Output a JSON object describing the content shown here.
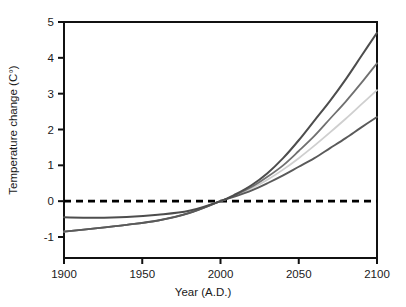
{
  "chart_data": {
    "type": "line",
    "title": "",
    "xlabel": "Year (A.D.)",
    "ylabel": "Temperature change (C°)",
    "xlim": [
      1900,
      2100
    ],
    "ylim": [
      -1,
      5
    ],
    "xticks": [
      1900,
      1950,
      2000,
      2050,
      2100
    ],
    "xtick_labels": [
      "1900",
      "1950",
      "2000",
      "2050",
      "2100"
    ],
    "yticks": [
      -1,
      0,
      1,
      2,
      3,
      4,
      5
    ],
    "ytick_labels": [
      "-1",
      "0",
      "1",
      "2",
      "3",
      "4",
      "5"
    ],
    "grid": false,
    "legend": "none",
    "annotations": [
      {
        "name": "zero-reference-line",
        "type": "hline",
        "y": 0,
        "style": "dashed",
        "color": "#000000"
      }
    ],
    "x": [
      1900,
      1920,
      1940,
      1960,
      1980,
      2000,
      2010,
      2020,
      2030,
      2040,
      2050,
      2060,
      2070,
      2080,
      2090,
      2100
    ],
    "series": [
      {
        "name": "highest-projection",
        "color": "#4d4d4d",
        "width": 2.0,
        "values": [
          -0.45,
          -0.46,
          -0.44,
          -0.38,
          -0.27,
          0.0,
          0.2,
          0.45,
          0.78,
          1.2,
          1.7,
          2.25,
          2.8,
          3.4,
          4.05,
          4.7
        ]
      },
      {
        "name": "high-projection",
        "color": "#707070",
        "width": 1.8,
        "values": [
          -0.85,
          -0.76,
          -0.66,
          -0.54,
          -0.33,
          0.0,
          0.18,
          0.4,
          0.68,
          1.0,
          1.4,
          1.82,
          2.3,
          2.78,
          3.3,
          3.85
        ]
      },
      {
        "name": "mid-projection",
        "color": "#cfcfcf",
        "width": 1.8,
        "values": [
          -0.85,
          -0.76,
          -0.66,
          -0.54,
          -0.33,
          0.0,
          0.16,
          0.36,
          0.6,
          0.88,
          1.2,
          1.55,
          1.92,
          2.3,
          2.7,
          3.1
        ]
      },
      {
        "name": "lowest-projection",
        "color": "#5a5a5a",
        "width": 1.9,
        "values": [
          -0.85,
          -0.76,
          -0.66,
          -0.54,
          -0.33,
          0.0,
          0.14,
          0.3,
          0.5,
          0.72,
          0.96,
          1.2,
          1.48,
          1.76,
          2.06,
          2.35
        ]
      }
    ]
  }
}
